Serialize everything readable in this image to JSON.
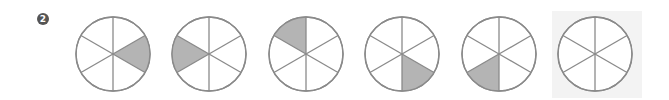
{
  "problem": {
    "number_label": "2",
    "description": "Pattern sequence of circles divided into sixths; one sixth shaded, rotating each step. Last circle is the blank answer slot."
  },
  "style": {
    "stroke_color": "#8a8a8a",
    "shade_color": "#b4b4b4",
    "answer_bg": "#f3f3f3"
  },
  "circles": [
    {
      "cx": 113,
      "cy": 54,
      "shaded_sector": 1
    },
    {
      "cx": 209,
      "cy": 54,
      "shaded_sector": 4
    },
    {
      "cx": 306,
      "cy": 54,
      "shaded_sector": 5
    },
    {
      "cx": 402,
      "cy": 54,
      "shaded_sector": 2
    },
    {
      "cx": 499,
      "cy": 54,
      "shaded_sector": 3
    },
    {
      "cx": 595,
      "cy": 54,
      "shaded_sector": null,
      "is_answer_slot": true
    }
  ],
  "radius": 37
}
